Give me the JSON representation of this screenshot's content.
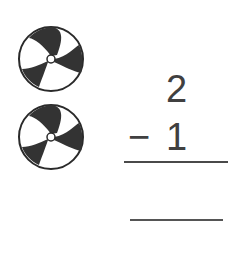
{
  "worksheet": {
    "objects": [
      {
        "type": "beach-ball",
        "count_index": 1
      },
      {
        "type": "beach-ball",
        "count_index": 2
      }
    ],
    "problem": {
      "minuend": "2",
      "operator": "−",
      "subtrahend": "1",
      "answer": ""
    }
  }
}
